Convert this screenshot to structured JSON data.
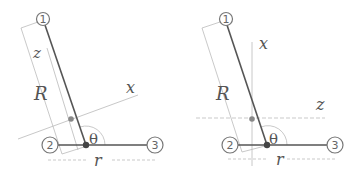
{
  "colors": {
    "bond": "#555555",
    "axis": "#bbbbbb",
    "dim": "#aaaaaa",
    "atom_outline": "#777777",
    "center_dot": "#444444",
    "com_dot": "#888888",
    "label": "#555555"
  },
  "left": {
    "atoms": [
      {
        "label": "1"
      },
      {
        "label": "2"
      },
      {
        "label": "3"
      }
    ],
    "labels": {
      "R": "R",
      "z": "z",
      "x": "x",
      "r": "r",
      "theta": "θ"
    }
  },
  "right": {
    "atoms": [
      {
        "label": "1"
      },
      {
        "label": "2"
      },
      {
        "label": "3"
      }
    ],
    "labels": {
      "R": "R",
      "z": "z",
      "x": "x",
      "r": "r",
      "theta": "θ"
    }
  }
}
